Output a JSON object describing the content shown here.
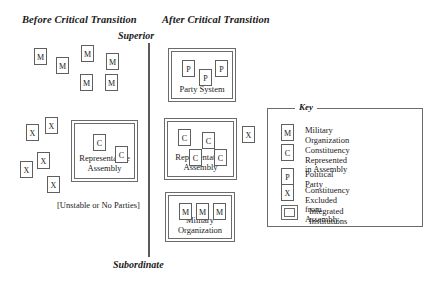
{
  "headings": {
    "before": "Before Critical Transition",
    "after": "After Critical Transition",
    "top_axis": "Superior",
    "bottom_axis": "Subordinate"
  },
  "before_panel": {
    "note": "[Unstable or No Parties]",
    "military_tokens": [
      {
        "label": "M",
        "x": 34,
        "y": 48
      },
      {
        "label": "M",
        "x": 56,
        "y": 57
      },
      {
        "label": "M",
        "x": 81,
        "y": 45
      },
      {
        "label": "M",
        "x": 106,
        "y": 53
      },
      {
        "label": "M",
        "x": 80,
        "y": 74
      },
      {
        "label": "M",
        "x": 105,
        "y": 74
      }
    ],
    "excluded_tokens": [
      {
        "label": "X",
        "x": 26,
        "y": 124
      },
      {
        "label": "X",
        "x": 45,
        "y": 117
      },
      {
        "label": "X",
        "x": 37,
        "y": 152
      },
      {
        "label": "X",
        "x": 20,
        "y": 161
      },
      {
        "label": "X",
        "x": 47,
        "y": 176
      }
    ],
    "assembly": {
      "label": "Representative\nAssembly",
      "x": 71,
      "y": 120,
      "w": 67,
      "h": 62,
      "tokens": [
        {
          "label": "C",
          "x": 18,
          "y": 10
        },
        {
          "label": "C",
          "x": 40,
          "y": 22
        }
      ]
    }
  },
  "after_panel": {
    "party_system": {
      "label": "Party System",
      "x": 168,
      "y": 48,
      "w": 68,
      "h": 54,
      "tokens": [
        {
          "label": "P",
          "x": 10,
          "y": 8
        },
        {
          "label": "P",
          "x": 27,
          "y": 17
        },
        {
          "label": "P",
          "x": 43,
          "y": 8
        }
      ]
    },
    "assembly": {
      "label": "Representative\nAssembly",
      "x": 164,
      "y": 118,
      "w": 73,
      "h": 62,
      "tokens": [
        {
          "label": "C",
          "x": 10,
          "y": 7
        },
        {
          "label": "C",
          "x": 34,
          "y": 10
        },
        {
          "label": "C",
          "x": 21,
          "y": 27
        },
        {
          "label": "C",
          "x": 46,
          "y": 27
        }
      ]
    },
    "military": {
      "label": "Military\nOrganization",
      "x": 165,
      "y": 192,
      "w": 70,
      "h": 50,
      "tokens": [
        {
          "label": "M",
          "x": 10,
          "y": 7
        },
        {
          "label": "M",
          "x": 27,
          "y": 7
        },
        {
          "label": "M",
          "x": 44,
          "y": 7
        }
      ]
    },
    "excluded_tokens": [
      {
        "label": "X",
        "x": 242,
        "y": 126
      }
    ]
  },
  "key": {
    "title": "Key",
    "box": {
      "x": 267,
      "y": 108,
      "w": 156,
      "h": 119
    },
    "rows": [
      {
        "token": "M",
        "text": "Military Organization"
      },
      {
        "token": "C",
        "text": "Constituency Represented\nin Assembly"
      },
      {
        "token": "P",
        "text": "Political Party"
      },
      {
        "token": "X",
        "text": "Constituency Excluded\nfrom Assembly"
      },
      {
        "token": "",
        "text": "Integrated Institutions"
      }
    ]
  },
  "colors": {
    "line": "#6b6b6b",
    "divider": "#5a5a5a",
    "text": "#1a1a1a",
    "background": "#ffffff"
  }
}
